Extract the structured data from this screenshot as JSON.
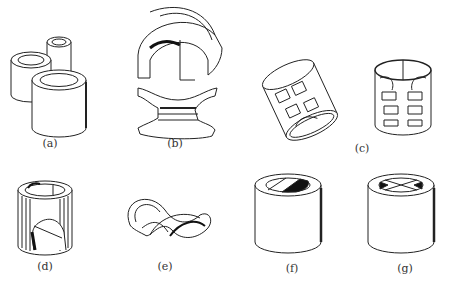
{
  "figure": {
    "panels": [
      {
        "id": "a",
        "label": "(a)",
        "x": 50,
        "y": 145
      },
      {
        "id": "b",
        "label": "(b)",
        "x": 175,
        "y": 145
      },
      {
        "id": "c",
        "label": "(c)",
        "x": 362,
        "y": 146
      },
      {
        "id": "d",
        "label": "(d)",
        "x": 45,
        "y": 264
      },
      {
        "id": "e",
        "label": "(e)",
        "x": 165,
        "y": 264
      },
      {
        "id": "f",
        "label": "(f)",
        "x": 292,
        "y": 264
      },
      {
        "id": "g",
        "label": "(g)",
        "x": 405,
        "y": 264
      }
    ]
  },
  "colors": {
    "line": "#222222",
    "fill": "#ffffff",
    "shadow": "#111111"
  }
}
